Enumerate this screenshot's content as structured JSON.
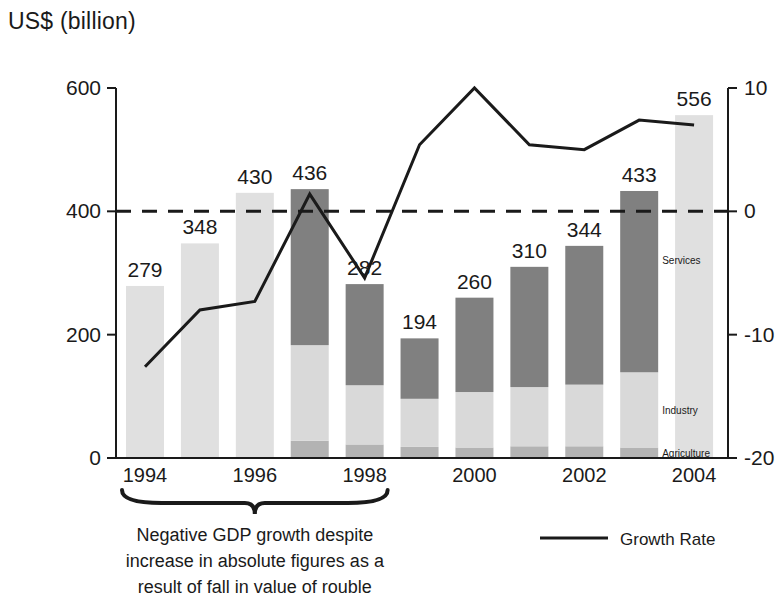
{
  "header": {
    "axis_unit_title": "US$ (billion)"
  },
  "legend": {
    "growth_rate_label": "Growth Rate"
  },
  "annotation": {
    "lines": [
      "Negative GDP growth despite",
      "increase in absolute figures as a",
      "result of fall in value of rouble"
    ],
    "brace_from_year": "1994",
    "brace_to_year": "1998"
  },
  "segment_labels": {
    "services": "Services",
    "industry": "Industry",
    "agriculture": "Agriculture"
  },
  "colors": {
    "services": "#808080",
    "industry": "#d9d9d9",
    "agriculture": "#b3b3b3",
    "plain_bar": "#e0e0e0",
    "line": "#1a1a1a",
    "axis": "#1a1a1a"
  },
  "chart_data": {
    "type": "bar",
    "title": "",
    "subtitle": "",
    "ylabel": "US$ (billion)",
    "xlabel": "",
    "y2label": "",
    "grid": false,
    "legend_position": "bottom-right",
    "categories": [
      "1994",
      "1995",
      "1996",
      "1997",
      "1998",
      "1999",
      "2000",
      "2001",
      "2002",
      "2003",
      "2004"
    ],
    "xtick_labels": [
      "1994",
      "",
      "1996",
      "",
      "1998",
      "",
      "2000",
      "",
      "2002",
      "",
      "2004"
    ],
    "ylim": [
      0,
      600
    ],
    "yticks": [
      0,
      200,
      400,
      600
    ],
    "ytick_labels": [
      "0",
      "200",
      "400",
      "600"
    ],
    "y2lim": [
      -20,
      10
    ],
    "y2ticks": [
      -20,
      -10,
      0,
      10
    ],
    "y2tick_labels": [
      "-20",
      "-10",
      "0",
      "10"
    ],
    "zero_growth_reference_line": 0,
    "series": [
      {
        "name": "GDP",
        "axis": "left",
        "values": [
          279,
          348,
          430,
          436,
          282,
          194,
          260,
          310,
          344,
          433,
          556
        ],
        "data_labels": [
          "279",
          "348",
          "430",
          "436",
          "282",
          "194",
          "260",
          "310",
          "344",
          "433",
          "556"
        ],
        "stacked_years": {
          "1997": {
            "agriculture": 28,
            "industry": 155,
            "services": 253
          },
          "1998": {
            "agriculture": 22,
            "industry": 96,
            "services": 164
          },
          "1999": {
            "agriculture": 18,
            "industry": 78,
            "services": 98
          },
          "2000": {
            "agriculture": 17,
            "industry": 90,
            "services": 153
          },
          "2001": {
            "agriculture": 19,
            "industry": 96,
            "services": 195
          },
          "2002": {
            "agriculture": 19,
            "industry": 100,
            "services": 225
          },
          "2003": {
            "agriculture": 17,
            "industry": 122,
            "services": 294
          }
        }
      },
      {
        "name": "Growth Rate",
        "axis": "right",
        "units": "%",
        "values": [
          -12.6,
          -8.0,
          -7.3,
          1.4,
          -5.4,
          5.4,
          10.0,
          5.4,
          5.0,
          7.4,
          7.0
        ]
      }
    ]
  }
}
